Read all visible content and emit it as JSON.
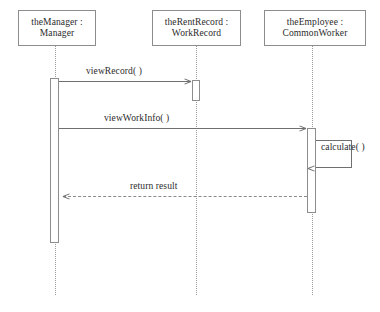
{
  "diagram": {
    "kind": "uml-sequence-diagram",
    "width": 380,
    "height": 312,
    "background_color": "#ffffff",
    "line_color": "#8d8d8d",
    "text_color": "#2b2b2b"
  },
  "participants": [
    {
      "id": "manager",
      "instance_name": "theManager :",
      "class_name": "Manager",
      "box": {
        "x": 18,
        "y": 10,
        "width": 78,
        "height": 36
      },
      "lifeline_x": 55,
      "lifeline_top": 46,
      "lifeline_bottom": 295
    },
    {
      "id": "rentrecord",
      "instance_name": "theRentRecord :",
      "class_name": "WorkRecord",
      "box": {
        "x": 152,
        "y": 10,
        "width": 89,
        "height": 36
      },
      "lifeline_x": 196,
      "lifeline_top": 46,
      "lifeline_bottom": 295
    },
    {
      "id": "employee",
      "instance_name": "theEmployee :",
      "class_name": "CommonWorker",
      "box": {
        "x": 264,
        "y": 10,
        "width": 102,
        "height": 36
      },
      "lifeline_x": 312,
      "lifeline_top": 46,
      "lifeline_bottom": 295
    }
  ],
  "activations": [
    {
      "id": "act-manager",
      "participant": "manager",
      "x": 50,
      "y": 78,
      "width": 9,
      "height": 165
    },
    {
      "id": "act-rentrecord",
      "participant": "rentrecord",
      "x": 192,
      "y": 80,
      "width": 8,
      "height": 21
    },
    {
      "id": "act-employee",
      "participant": "employee",
      "x": 307,
      "y": 128,
      "width": 9,
      "height": 85
    }
  ],
  "messages": [
    {
      "id": "msg-viewrecord",
      "label": "viewRecord( )",
      "from": "manager",
      "to": "rentrecord",
      "style": "solid",
      "direction": "right",
      "line": {
        "x": 59,
        "y": 81,
        "width": 132
      },
      "label_pos": {
        "x": 86,
        "y": 66
      }
    },
    {
      "id": "msg-viewworkinfo",
      "label": "viewWorkInfo( )",
      "from": "manager",
      "to": "employee",
      "style": "solid",
      "direction": "right",
      "line": {
        "x": 59,
        "y": 128,
        "width": 247
      },
      "label_pos": {
        "x": 104,
        "y": 113
      }
    },
    {
      "id": "msg-calculate",
      "label": "calculate( )",
      "from": "employee",
      "to": "employee",
      "style": "self",
      "direction": "left",
      "loop": {
        "x": 316,
        "y": 140,
        "width": 36,
        "height": 28
      },
      "label_pos": {
        "x": 321,
        "y": 142
      }
    },
    {
      "id": "msg-returnresult",
      "label": "return result",
      "from": "employee",
      "to": "manager",
      "style": "dashed",
      "direction": "left",
      "line": {
        "x": 63,
        "y": 196,
        "width": 244
      },
      "label_pos": {
        "x": 130,
        "y": 181
      }
    }
  ]
}
